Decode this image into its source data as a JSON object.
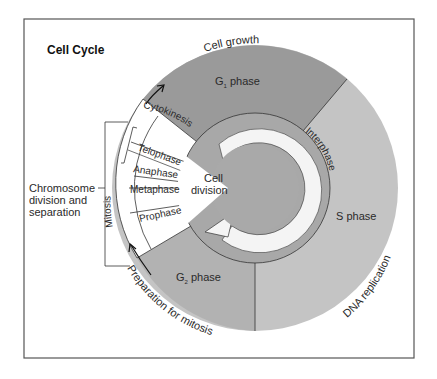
{
  "title": "Cell Cycle",
  "colors": {
    "g1": "#9a9a9a",
    "s": "#c4c4c4",
    "g2": "#b2b2b2",
    "ring": "#a8a8a8",
    "ring_band": "#f4f4f4",
    "center": "#a9a9a9",
    "mitosis": "#ffffff",
    "line": "#333333",
    "frame": "#555555"
  },
  "phases": {
    "g1": {
      "name": "G",
      "sub": "1",
      "suffix": " phase",
      "arc_label": "Cell growth"
    },
    "s": {
      "label": "S phase",
      "arc_label": "DNA replication"
    },
    "g2": {
      "name": "G",
      "sub": "2",
      "suffix": " phase",
      "arc_label": "Preparation for mitosis"
    },
    "interphase": {
      "label": "Interphase"
    },
    "cell_division": {
      "line1": "Cell",
      "line2": "division"
    }
  },
  "mitosis": {
    "label": "Mitosis",
    "stages": [
      "Cytokinesis",
      "Telophase",
      "Anaphase",
      "Metaphase",
      "Prophase"
    ]
  },
  "side_note": {
    "lines": [
      "Chromosome",
      "division and",
      "separation"
    ]
  }
}
